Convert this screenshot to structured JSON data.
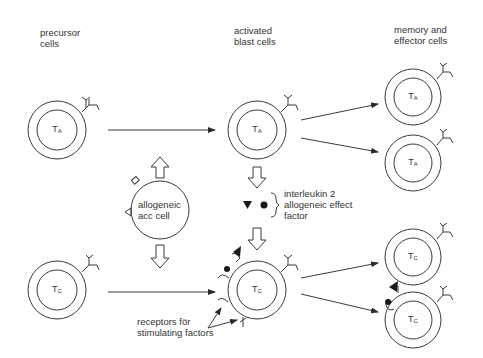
{
  "columns": {
    "precursor": "precursor\ncells",
    "activated": "activated\nblast cells",
    "memory": "memory and\neffector cells"
  },
  "cells": {
    "precursor_ta": {
      "main": "T",
      "sub": "A"
    },
    "precursor_tc": {
      "main": "T",
      "sub": "C"
    },
    "blast_ta": {
      "main": "T",
      "sub": "A"
    },
    "blast_tc": {
      "main": "T",
      "sub": "C"
    },
    "memory_ta_1": {
      "main": "T",
      "sub": "A"
    },
    "memory_ta_2": {
      "main": "T",
      "sub": "A"
    },
    "memory_tc_1": {
      "main": "T",
      "sub": "C"
    },
    "memory_tc_2": {
      "main": "T",
      "sub": "C"
    }
  },
  "acc_cell": "allogeneic\nacc cell",
  "factors_label": "interleukin 2\nallogeneic effect\nfactor",
  "receptors_label": "receptors för\nstimulating factors",
  "colors": {
    "line": "#3a3a3a",
    "background": "#ffffff"
  }
}
